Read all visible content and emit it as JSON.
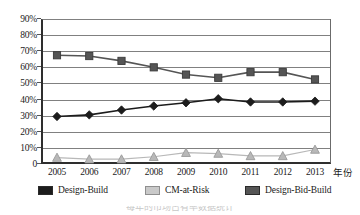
{
  "chart_data": {
    "type": "line",
    "title": "",
    "xlabel": "年份",
    "ylabel": "",
    "categories": [
      "2005",
      "2006",
      "2007",
      "2008",
      "2009",
      "2010",
      "2011",
      "2012",
      "2013"
    ],
    "ylim": [
      0,
      90
    ],
    "ytick_labels": [
      "90%",
      "80%",
      "70%",
      "60%",
      "50%",
      "40%",
      "30%",
      "20%",
      "10%",
      "0"
    ],
    "ytick_values": [
      90,
      80,
      70,
      60,
      50,
      40,
      30,
      20,
      10,
      0
    ],
    "grid": true,
    "legend_position": "bottom",
    "series": [
      {
        "name": "Design-Build",
        "marker": "diamond",
        "color": "#1c1c1c",
        "values": [
          29.5,
          30.5,
          33.5,
          36.0,
          38.0,
          40.5,
          38.5,
          38.5,
          39.0
        ]
      },
      {
        "name": "CM-at-Risk",
        "marker": "triangle",
        "color": "#b8b8b8",
        "values": [
          4.0,
          3.0,
          3.0,
          4.5,
          7.0,
          6.5,
          5.0,
          5.0,
          9.0
        ]
      },
      {
        "name": "Design-Bid-Build",
        "marker": "square",
        "color": "#555555",
        "values": [
          67.5,
          67.0,
          64.0,
          60.0,
          55.5,
          53.5,
          57.0,
          57.0,
          52.5
        ]
      }
    ]
  },
  "legend": {
    "items": [
      {
        "label": "Design-Build",
        "color": "#1c1c1c"
      },
      {
        "label": "CM-at-Risk",
        "color": "#c9c9c9"
      },
      {
        "label": "Design-Bid-Build",
        "color": "#555555"
      }
    ]
  },
  "axis": {
    "x_title": "年份"
  },
  "caption": {
    "text": "每年的市场占有率数据统计"
  }
}
